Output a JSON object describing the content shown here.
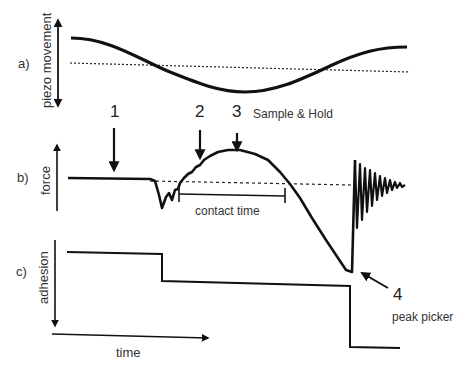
{
  "panels": {
    "a": {
      "label": "a)",
      "axis": "piezo movement"
    },
    "b": {
      "label": "b)",
      "axis": "force"
    },
    "c": {
      "label": "c)",
      "axis": "adhesion"
    }
  },
  "x_axis": {
    "label": "time"
  },
  "markers": [
    {
      "number": "1"
    },
    {
      "number": "2"
    },
    {
      "number": "3",
      "caption": "Sample & Hold"
    },
    {
      "number": "4",
      "caption": "peak picker"
    }
  ],
  "annotations": {
    "contact_time": "contact time"
  },
  "colors": {
    "line": "#111111",
    "text": "#333333",
    "background": "#ffffff"
  }
}
